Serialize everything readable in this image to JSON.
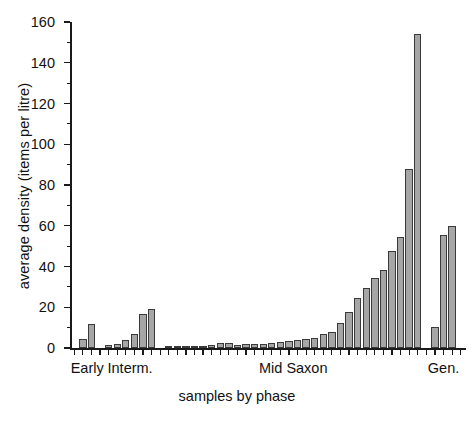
{
  "chart_data": {
    "type": "bar",
    "title": "",
    "subtitle": "",
    "xlabel": "samples by phase",
    "ylabel": "average density (items per litre)",
    "ylim": [
      0,
      160
    ],
    "yticks": [
      0,
      20,
      40,
      60,
      80,
      100,
      120,
      140,
      160
    ],
    "ytick_labels": [
      "0",
      "20",
      "40",
      "60",
      "80",
      "100",
      "120",
      "140",
      "160"
    ],
    "grid": false,
    "legend": null,
    "bar_color": "#a6a6a6",
    "bar_edge_color": "#3a3a3a",
    "axis_color": "#1a1a1a",
    "n_positions": 46,
    "xtick_labels_visible": false,
    "phase_groups": [
      {
        "name": "Early",
        "label": "Early",
        "start_index": 1,
        "end_index": 2,
        "label_center_index": 1.5
      },
      {
        "name": "Interm.",
        "label": "Interm.",
        "start_index": 4,
        "end_index": 9,
        "label_center_index": 6.5
      },
      {
        "name": "Mid Saxon",
        "label": "Mid Saxon",
        "start_index": 11,
        "end_index": 40,
        "label_center_index": 25.5
      },
      {
        "name": "Gen.",
        "label": "Gen.",
        "start_index": 42,
        "end_index": 44,
        "label_center_index": 43.0
      }
    ],
    "categories": [
      "s1",
      "s2",
      "s3",
      "s4",
      "s5",
      "s6",
      "s7",
      "s8",
      "s9",
      "s10",
      "s11",
      "s12",
      "s13",
      "s14",
      "s15",
      "s16",
      "s17",
      "s18",
      "s19",
      "s20",
      "s21",
      "s22",
      "s23",
      "s24",
      "s25",
      "s26",
      "s27",
      "s28",
      "s29",
      "s30",
      "s31",
      "s32",
      "s33",
      "s34",
      "s35",
      "s36",
      "s37",
      "s38",
      "s39",
      "s40",
      "s41",
      "s42",
      "s43",
      "s44",
      "s45",
      "s46"
    ],
    "values": [
      0,
      4.5,
      12,
      0,
      1.5,
      2,
      4,
      7,
      16.5,
      19,
      0,
      0.4,
      0.5,
      0.6,
      0.8,
      1.2,
      1.5,
      2.5,
      2.7,
      1.6,
      1.8,
      2.0,
      2.2,
      2.6,
      3.0,
      3.2,
      4.0,
      4.5,
      5.0,
      7.0,
      8.0,
      12.5,
      17.5,
      24.5,
      29.5,
      34.5,
      38.5,
      47.5,
      54.5,
      88,
      154,
      0,
      10.5,
      55.5,
      60,
      0
    ]
  }
}
